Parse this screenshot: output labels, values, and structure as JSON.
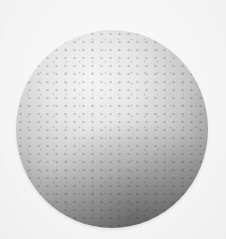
{
  "image": {
    "subject": "styrofoam ball",
    "background_color": "#f6f6f6",
    "ball": {
      "highlight_color": "#f4f4f4",
      "midtone_color": "#c8c8c8",
      "shadow_color": "#5a5a5a",
      "light_direction": "upper-left"
    }
  }
}
